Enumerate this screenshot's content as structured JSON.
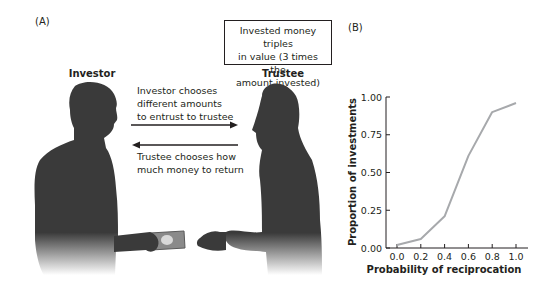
{
  "panel_a": {
    "label": "(A)",
    "box_note": {
      "line1": "Invested money triples",
      "line2": "in value (3 times the",
      "line3": "amount invested)"
    },
    "investor_label": "Investor",
    "trustee_label": "Trustee",
    "arrow_right_caption": {
      "line1": "Investor chooses",
      "line2": "different amounts",
      "line3": "to entrust to trustee"
    },
    "arrow_left_caption": {
      "line1": "Trustee chooses how",
      "line2": "much money to return"
    },
    "colors": {
      "silhouette": "#3a3a3a",
      "banknote": "#8a8a8a"
    }
  },
  "panel_b": {
    "label": "(B)"
  },
  "chart_data": {
    "type": "line",
    "title": "",
    "xlabel": "Probability of reciprocation",
    "ylabel": "Proportion of investments",
    "x": [
      0.0,
      0.2,
      0.4,
      0.6,
      0.8,
      1.0
    ],
    "series": [
      {
        "name": "Proportion of investments",
        "values": [
          0.02,
          0.06,
          0.21,
          0.61,
          0.9,
          0.96
        ]
      }
    ],
    "x_tick_labels": [
      "0.0",
      "0.2",
      "0.4",
      "0.6",
      "0.8",
      "1.0"
    ],
    "y_tick_labels": [
      "0.00",
      "0.25",
      "0.50",
      "0.75",
      "1.00"
    ],
    "y_ticks": [
      0.0,
      0.25,
      0.5,
      0.75,
      1.0
    ],
    "xlim": [
      -0.1,
      1.1
    ],
    "ylim": [
      0,
      1.0
    ],
    "grid": false,
    "legend": "none",
    "line_color": "#a7a9ac"
  }
}
